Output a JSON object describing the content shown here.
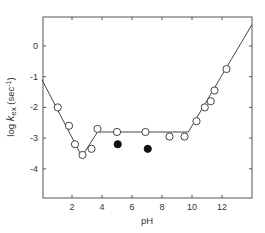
{
  "chart_data": {
    "type": "scatter",
    "title": "",
    "xlabel": "pH",
    "ylabel": "log k_ex (sec^-1)",
    "ylabel_parts": {
      "prefix": "log ",
      "k": "k",
      "sub": "ex",
      "unit": " (sec",
      "exp": "-1",
      "close": ")"
    },
    "xlim": [
      0,
      14
    ],
    "ylim": [
      -5.0,
      1.0
    ],
    "xticks": [
      2,
      4,
      6,
      8,
      10,
      12
    ],
    "yticks": [
      0,
      -1,
      -2,
      -3,
      -4
    ],
    "grid": false,
    "legend": null,
    "series": [
      {
        "name": "open circles (measured)",
        "marker": "open-circle",
        "points": [
          {
            "x": 1.05,
            "y": -2.0
          },
          {
            "x": 1.8,
            "y": -2.6
          },
          {
            "x": 2.2,
            "y": -3.2
          },
          {
            "x": 2.7,
            "y": -3.55
          },
          {
            "x": 3.3,
            "y": -3.35
          },
          {
            "x": 3.7,
            "y": -2.7
          },
          {
            "x": 5.0,
            "y": -2.8
          },
          {
            "x": 6.9,
            "y": -2.8
          },
          {
            "x": 8.5,
            "y": -2.95
          },
          {
            "x": 9.5,
            "y": -2.95
          },
          {
            "x": 10.3,
            "y": -2.45
          },
          {
            "x": 10.85,
            "y": -2.0
          },
          {
            "x": 11.25,
            "y": -1.8
          },
          {
            "x": 11.5,
            "y": -1.45
          },
          {
            "x": 12.3,
            "y": -0.75
          }
        ]
      },
      {
        "name": "filled circles",
        "marker": "filled-circle",
        "points": [
          {
            "x": 5.05,
            "y": -3.2
          },
          {
            "x": 7.05,
            "y": -3.35
          }
        ]
      },
      {
        "name": "fit line",
        "marker": "line",
        "points": [
          {
            "x": 0.0,
            "y": -1.1
          },
          {
            "x": 2.65,
            "y": -3.6
          },
          {
            "x": 3.7,
            "y": -2.8
          },
          {
            "x": 9.75,
            "y": -2.8
          },
          {
            "x": 14.0,
            "y": 0.7
          }
        ]
      }
    ]
  }
}
